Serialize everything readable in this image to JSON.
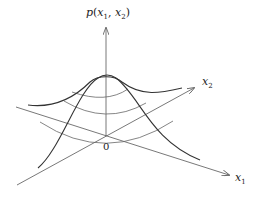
{
  "diagram": {
    "labels": {
      "vertical_axis": {
        "base": "p",
        "args_open": "(",
        "x1": "x",
        "x1_sub": "1",
        "sep": ", ",
        "x2": "x",
        "x2_sub": "2",
        "args_close": ")"
      },
      "x2_axis": {
        "base": "x",
        "sub": "2"
      },
      "x1_axis": {
        "base": "x",
        "sub": "1"
      },
      "origin": "0"
    },
    "colors": {
      "axis": "#555555",
      "curve": "#333333",
      "level_curve": "#666666"
    }
  }
}
